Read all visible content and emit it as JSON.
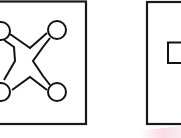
{
  "figure": {
    "stroke_color": "#1a1a1a",
    "background_color": "#ffffff",
    "panels": [
      {
        "name": "panel-left",
        "shape": "x-cross-with-corner-circles",
        "circles": 4
      },
      {
        "name": "panel-right",
        "shape": "small-rectangle",
        "partially_visible": true
      }
    ],
    "accent_smudge_color": "#f5bed2"
  }
}
